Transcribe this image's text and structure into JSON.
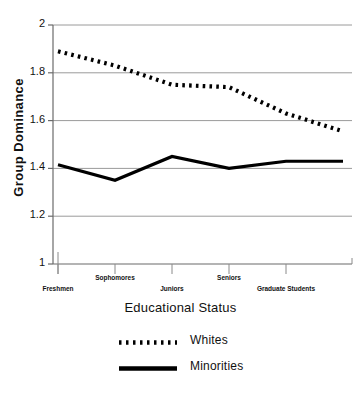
{
  "chart_data": {
    "type": "line",
    "title": "",
    "xlabel": "Educational Status",
    "ylabel": "Group Dominance",
    "categories": [
      "Freshmen",
      "Sophomores",
      "Juniors",
      "Seniors",
      "Graduate Students",
      ""
    ],
    "xtick_labels": [
      "Freshmen",
      "Sophomores",
      "Juniors",
      "Seniors",
      "Graduate Students"
    ],
    "ylim": [
      1,
      2
    ],
    "yticks": [
      1,
      1.2,
      1.4,
      1.6,
      1.8,
      2
    ],
    "ytick_labels": [
      "1",
      "1.2",
      "1.4",
      "1.6",
      "1.8",
      "2"
    ],
    "grid": "horizontal",
    "legend_position": "bottom",
    "series": [
      {
        "name": "Whites",
        "style": "dotted",
        "color": "#000000",
        "values": [
          1.89,
          1.83,
          1.75,
          1.74,
          1.63,
          1.555
        ]
      },
      {
        "name": "Minorities",
        "style": "solid",
        "color": "#000000",
        "values": [
          1.415,
          1.35,
          1.45,
          1.4,
          1.43,
          1.43
        ]
      }
    ]
  },
  "legend": {
    "items": [
      {
        "label": "Whites",
        "style": "dotted"
      },
      {
        "label": "Minorities",
        "style": "solid"
      }
    ]
  },
  "axes": {
    "y_title": "Group Dominance",
    "x_title": "Educational Status"
  }
}
